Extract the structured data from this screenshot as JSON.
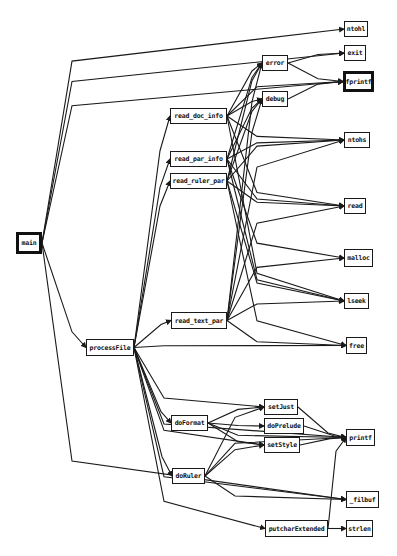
{
  "diagram": {
    "type": "call-graph",
    "nodes": [
      {
        "id": "main",
        "label": "main",
        "x": 16,
        "y": 232,
        "w": 26,
        "h": 22,
        "thick": true
      },
      {
        "id": "processFile",
        "label": "processFile",
        "x": 86,
        "y": 339,
        "w": 48,
        "h": 17
      },
      {
        "id": "read_doc_info",
        "label": "read_doc_info",
        "x": 170,
        "y": 108,
        "w": 57,
        "h": 16
      },
      {
        "id": "read_par_info",
        "label": "read_par_info",
        "x": 170,
        "y": 151,
        "w": 57,
        "h": 16
      },
      {
        "id": "read_ruler_par",
        "label": "read_ruler_par",
        "x": 170,
        "y": 173,
        "w": 57,
        "h": 16
      },
      {
        "id": "read_text_par",
        "label": "read_text_par",
        "x": 171,
        "y": 312,
        "w": 56,
        "h": 17
      },
      {
        "id": "error",
        "label": "error",
        "x": 262,
        "y": 55,
        "w": 26,
        "h": 16
      },
      {
        "id": "debug",
        "label": "debug",
        "x": 262,
        "y": 91,
        "w": 26,
        "h": 16
      },
      {
        "id": "doFormat",
        "label": "doFormat",
        "x": 171,
        "y": 415,
        "w": 37,
        "h": 16
      },
      {
        "id": "doRuler",
        "label": "doRuler",
        "x": 172,
        "y": 468,
        "w": 33,
        "h": 16
      },
      {
        "id": "setJust",
        "label": "setJust",
        "x": 264,
        "y": 399,
        "w": 34,
        "h": 16
      },
      {
        "id": "doPrelude",
        "label": "doPrelude",
        "x": 264,
        "y": 418,
        "w": 40,
        "h": 16
      },
      {
        "id": "setStyle",
        "label": "setStyle",
        "x": 264,
        "y": 437,
        "w": 36,
        "h": 16
      },
      {
        "id": "putcharExtended",
        "label": "putcharExtended",
        "x": 265,
        "y": 520,
        "w": 63,
        "h": 17
      },
      {
        "id": "ntohl",
        "label": "ntohl",
        "x": 344,
        "y": 21,
        "w": 24,
        "h": 16
      },
      {
        "id": "exit",
        "label": "exit",
        "x": 344,
        "y": 45,
        "w": 22,
        "h": 16
      },
      {
        "id": "fprintf",
        "label": "fprintf",
        "x": 343,
        "y": 71,
        "w": 31,
        "h": 21,
        "thick": true
      },
      {
        "id": "ntohs",
        "label": "ntohs",
        "x": 344,
        "y": 132,
        "w": 26,
        "h": 16
      },
      {
        "id": "read",
        "label": "read",
        "x": 344,
        "y": 198,
        "w": 22,
        "h": 16
      },
      {
        "id": "malloc",
        "label": "malloc",
        "x": 344,
        "y": 249,
        "w": 29,
        "h": 18
      },
      {
        "id": "lseek",
        "label": "lseek",
        "x": 344,
        "y": 293,
        "w": 25,
        "h": 16
      },
      {
        "id": "free",
        "label": "free",
        "x": 346,
        "y": 337,
        "w": 21,
        "h": 17
      },
      {
        "id": "printf",
        "label": "printf",
        "x": 346,
        "y": 429,
        "w": 29,
        "h": 17
      },
      {
        "id": "_filbuf",
        "label": "_filbuf",
        "x": 346,
        "y": 491,
        "w": 33,
        "h": 17
      },
      {
        "id": "strlen",
        "label": "strlen",
        "x": 346,
        "y": 520,
        "w": 27,
        "h": 17
      }
    ],
    "edges": [
      [
        "main",
        "ntohl"
      ],
      [
        "main",
        "exit"
      ],
      [
        "main",
        "fprintf"
      ],
      [
        "main",
        "processFile"
      ],
      [
        "main",
        "_filbuf"
      ],
      [
        "processFile",
        "read_doc_info"
      ],
      [
        "processFile",
        "read_par_info"
      ],
      [
        "processFile",
        "read_ruler_par"
      ],
      [
        "processFile",
        "read_text_par"
      ],
      [
        "processFile",
        "free"
      ],
      [
        "processFile",
        "setJust"
      ],
      [
        "processFile",
        "doFormat"
      ],
      [
        "processFile",
        "setStyle"
      ],
      [
        "processFile",
        "doRuler"
      ],
      [
        "processFile",
        "printf"
      ],
      [
        "processFile",
        "_filbuf"
      ],
      [
        "processFile",
        "putcharExtended"
      ],
      [
        "read_doc_info",
        "error"
      ],
      [
        "read_doc_info",
        "debug"
      ],
      [
        "read_doc_info",
        "ntohs"
      ],
      [
        "read_doc_info",
        "read"
      ],
      [
        "read_doc_info",
        "lseek"
      ],
      [
        "read_doc_info",
        "fprintf"
      ],
      [
        "read_par_info",
        "error"
      ],
      [
        "read_par_info",
        "debug"
      ],
      [
        "read_par_info",
        "ntohs"
      ],
      [
        "read_par_info",
        "read"
      ],
      [
        "read_par_info",
        "malloc"
      ],
      [
        "read_par_info",
        "lseek"
      ],
      [
        "read_ruler_par",
        "error"
      ],
      [
        "read_ruler_par",
        "debug"
      ],
      [
        "read_ruler_par",
        "ntohs"
      ],
      [
        "read_ruler_par",
        "read"
      ],
      [
        "read_ruler_par",
        "lseek"
      ],
      [
        "read_ruler_par",
        "free"
      ],
      [
        "read_text_par",
        "error"
      ],
      [
        "read_text_par",
        "debug"
      ],
      [
        "read_text_par",
        "ntohs"
      ],
      [
        "read_text_par",
        "read"
      ],
      [
        "read_text_par",
        "malloc"
      ],
      [
        "read_text_par",
        "lseek"
      ],
      [
        "read_text_par",
        "free"
      ],
      [
        "error",
        "exit"
      ],
      [
        "error",
        "fprintf"
      ],
      [
        "debug",
        "fprintf"
      ],
      [
        "doFormat",
        "setJust"
      ],
      [
        "doFormat",
        "doPrelude"
      ],
      [
        "doFormat",
        "setStyle"
      ],
      [
        "doFormat",
        "printf"
      ],
      [
        "doRuler",
        "setJust"
      ],
      [
        "doRuler",
        "setStyle"
      ],
      [
        "doRuler",
        "printf"
      ],
      [
        "doRuler",
        "_filbuf"
      ],
      [
        "setJust",
        "printf"
      ],
      [
        "doPrelude",
        "printf"
      ],
      [
        "setStyle",
        "printf"
      ],
      [
        "putcharExtended",
        "strlen"
      ],
      [
        "putcharExtended",
        "printf"
      ]
    ]
  }
}
